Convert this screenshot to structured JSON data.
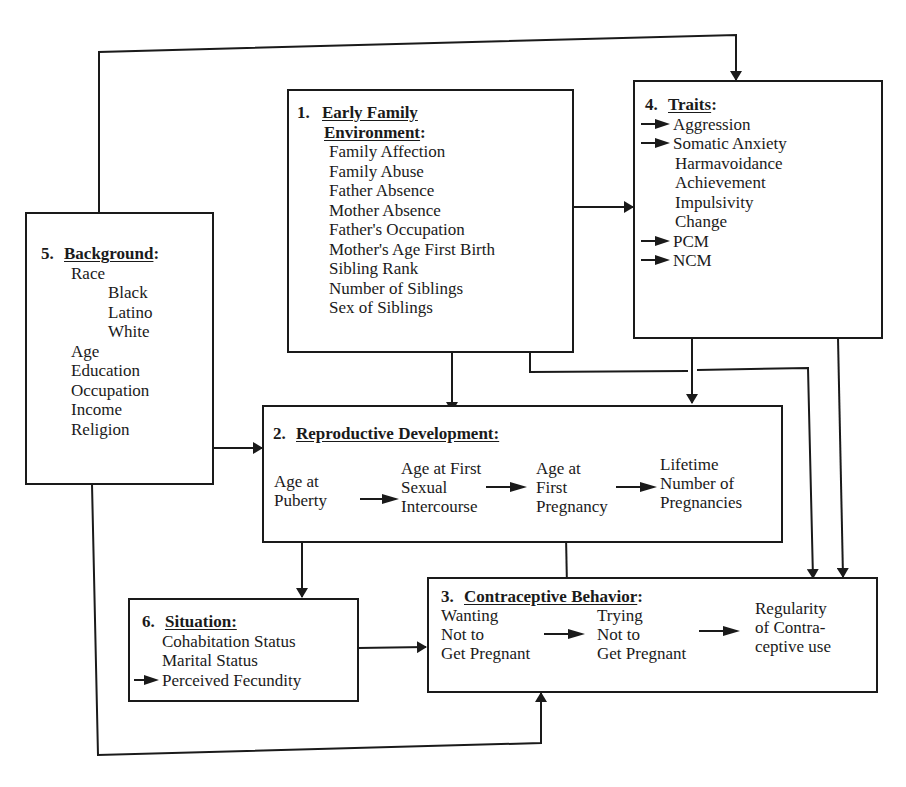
{
  "diagram": {
    "nodes": {
      "early_family": {
        "number": "1.",
        "title_line1": "Early Family",
        "title_line2": "Environment",
        "colon": ":",
        "items": [
          "Family Affection",
          "Family Abuse",
          "Father Absence",
          "Mother Absence",
          "Father's Occupation",
          "Mother's Age First Birth",
          "Sibling Rank",
          "Number of Siblings",
          "Sex of Siblings"
        ]
      },
      "reproductive": {
        "number": "2.",
        "title": "Reproductive Development:",
        "stages": [
          [
            "Age at",
            "Puberty"
          ],
          [
            "Age at First",
            "Sexual",
            "Intercourse"
          ],
          [
            "Age at",
            "First",
            "Pregnancy"
          ],
          [
            "Lifetime",
            "Number of",
            "Pregnancies"
          ]
        ]
      },
      "contraceptive": {
        "number": "3.",
        "title": "Contraceptive Behavior",
        "colon": ":",
        "stages": [
          [
            "Wanting",
            "Not to",
            "Get Pregnant"
          ],
          [
            "Trying",
            "Not to",
            "Get Pregnant"
          ],
          [
            "Regularity",
            "of Contra-",
            "ceptive use"
          ]
        ]
      },
      "traits": {
        "number": "4.",
        "title": "Traits",
        "colon": ":",
        "items": [
          {
            "label": "Aggression",
            "arrow": true
          },
          {
            "label": "Somatic Anxiety",
            "arrow": true
          },
          {
            "label": "Harmavoidance",
            "arrow": false
          },
          {
            "label": "Achievement",
            "arrow": false
          },
          {
            "label": "Impulsivity",
            "arrow": false
          },
          {
            "label": "Change",
            "arrow": false
          },
          {
            "label": "PCM",
            "arrow": true
          },
          {
            "label": "NCM",
            "arrow": true
          }
        ]
      },
      "background": {
        "number": "5.",
        "title": "Background",
        "colon": ":",
        "items": [
          {
            "label": "Race",
            "indent": false
          },
          {
            "label": "Black",
            "indent": true
          },
          {
            "label": "Latino",
            "indent": true
          },
          {
            "label": "White",
            "indent": true
          },
          {
            "label": "Age",
            "indent": false
          },
          {
            "label": "Education",
            "indent": false
          },
          {
            "label": "Occupation",
            "indent": false
          },
          {
            "label": "Income",
            "indent": false
          },
          {
            "label": "Religion",
            "indent": false
          }
        ]
      },
      "situation": {
        "number": "6.",
        "title": "Situation:",
        "items": [
          {
            "label": "Cohabitation Status",
            "arrow": false
          },
          {
            "label": "Marital Status",
            "arrow": false
          },
          {
            "label": "Perceived Fecundity",
            "arrow": true
          }
        ]
      }
    },
    "edges": [
      {
        "from": "5. Background",
        "to": "4. Traits"
      },
      {
        "from": "1. Early Family Environment",
        "to": "4. Traits"
      },
      {
        "from": "1. Early Family Environment",
        "to": "2. Reproductive Development"
      },
      {
        "from": "1. Early Family Environment",
        "to": "3. Contraceptive Behavior"
      },
      {
        "from": "4. Traits",
        "to": "2. Reproductive Development"
      },
      {
        "from": "4. Traits",
        "to": "3. Contraceptive Behavior"
      },
      {
        "from": "5. Background",
        "to": "2. Reproductive Development"
      },
      {
        "from": "5. Background",
        "to": "3. Contraceptive Behavior"
      },
      {
        "from": "2. Reproductive Development",
        "to": "6. Situation"
      },
      {
        "from": "2. Reproductive Development",
        "to": "3. Contraceptive Behavior"
      },
      {
        "from": "6. Situation",
        "to": "3. Contraceptive Behavior"
      }
    ],
    "colors": {
      "line": "#1a1a1a",
      "background": "#ffffff"
    }
  }
}
